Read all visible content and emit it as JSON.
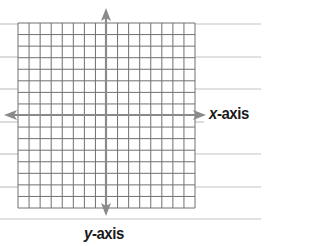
{
  "diagram": {
    "type": "coordinate-plane",
    "grid": {
      "columns": 16,
      "rows": 16,
      "left": 18,
      "top": 23,
      "right": 195,
      "bottom": 208
    },
    "x_axis": {
      "variable": "x",
      "suffix": "-axis",
      "y": 115,
      "from": 4,
      "to": 206
    },
    "y_axis": {
      "variable": "y",
      "suffix": "-axis",
      "x": 106,
      "from": 8,
      "to": 216
    },
    "ruled_lines_y": [
      24,
      57,
      89,
      122,
      154,
      187,
      219
    ],
    "colors": {
      "grid": "#707070",
      "axis": "#8a8a8a",
      "ruled": "#c4c4c4",
      "label": "#1a1a1a"
    }
  },
  "labels": {
    "x_var": "x",
    "x_suffix": "-axis",
    "y_var": "y",
    "y_suffix": "-axis"
  }
}
